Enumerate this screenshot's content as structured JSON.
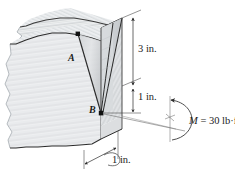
{
  "figure": {
    "kind": "engineering-mechanics-diagram",
    "points": [
      {
        "id": "A",
        "label": "A",
        "x": 78,
        "y": 64
      },
      {
        "id": "B",
        "label": "B",
        "x": 101,
        "y": 113
      }
    ],
    "dimensions": [
      {
        "id": "height-3in",
        "label": "3 in.",
        "value": 3,
        "unit": "in."
      },
      {
        "id": "height-1in",
        "label": "1 in.",
        "value": 1,
        "unit": "in."
      },
      {
        "id": "depth-1in",
        "label": "1 in.",
        "value": 1,
        "unit": "in."
      }
    ],
    "moment": {
      "symbol": "M",
      "equals": "=",
      "magnitude": "30",
      "unit": "lb·ft",
      "full_label": "M = 30 lb·ft"
    },
    "colors": {
      "line": "#262626",
      "thin_line": "#6e6e6e",
      "grain": "#b9bdc2",
      "face_left": "#f2f3f4",
      "face_right": "#e4e6e8",
      "face_top": "#eceef0",
      "notch": "#d2d5d8",
      "text": "#1b1b1b",
      "background": "#ffffff"
    }
  }
}
